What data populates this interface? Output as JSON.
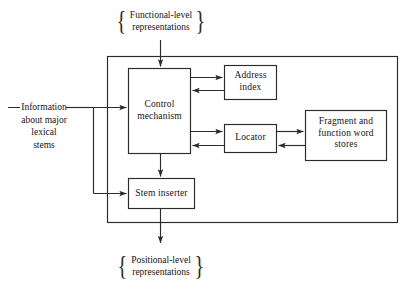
{
  "diagram": {
    "stroke_color": "#2b2b2b",
    "background_color": "#ffffff",
    "text_color": "#151515",
    "inputs": {
      "top": {
        "text_line_1": "Functional-level",
        "text_line_2": "representations",
        "left_brace": "{",
        "right_brace": "}"
      },
      "left": {
        "dash": "—",
        "text_line_1": "Information",
        "text_line_2": "about major",
        "text_line_3": "lexical stems"
      }
    },
    "outputs": {
      "bottom": {
        "text_line_1": "Positional-level",
        "text_line_2": "representations",
        "left_brace": "{",
        "right_brace": "}"
      }
    },
    "nodes": [
      {
        "id": "control-mechanism",
        "line_1": "Control",
        "line_2": "mechanism"
      },
      {
        "id": "address-index",
        "line_1": "Address",
        "line_2": "index"
      },
      {
        "id": "locator",
        "line_1": "Locator"
      },
      {
        "id": "fragment-stores",
        "line_1": "Fragment and",
        "line_2": "function word",
        "line_3": "stores"
      },
      {
        "id": "stem-inserter",
        "line_1": "Stem inserter"
      }
    ],
    "edges": [
      {
        "from": "functional-level-representations",
        "to": "control-mechanism",
        "direction": "down"
      },
      {
        "from": "information-about-major-lexical-stems",
        "to": "control-mechanism",
        "direction": "right"
      },
      {
        "from": "information-about-major-lexical-stems",
        "to": "stem-inserter",
        "direction": "right"
      },
      {
        "from": "control-mechanism",
        "to": "address-index",
        "direction": "right"
      },
      {
        "from": "address-index",
        "to": "control-mechanism",
        "direction": "left"
      },
      {
        "from": "control-mechanism",
        "to": "locator",
        "direction": "right"
      },
      {
        "from": "locator",
        "to": "control-mechanism",
        "direction": "left"
      },
      {
        "from": "locator",
        "to": "fragment-stores",
        "direction": "right"
      },
      {
        "from": "fragment-stores",
        "to": "locator",
        "direction": "left"
      },
      {
        "from": "control-mechanism",
        "to": "stem-inserter",
        "direction": "down"
      },
      {
        "from": "stem-inserter",
        "to": "positional-level-representations",
        "direction": "down"
      }
    ]
  }
}
